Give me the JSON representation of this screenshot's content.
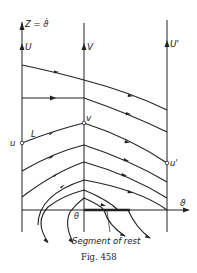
{
  "figure": {
    "caption": "Fig. 458",
    "z_axis_label": "Z = ϑ̇",
    "theta_axis_label": "ϑ",
    "axis_labels": {
      "left_top": "U",
      "middle_top": "V",
      "right_top": "U'"
    },
    "point_labels": {
      "u": "u",
      "v": "v",
      "u_prime": "u'",
      "L": "L",
      "theta": "θ"
    },
    "annotation": "Segment of rest",
    "colors": {
      "ink": "#222222",
      "background": "#ffffff"
    }
  }
}
